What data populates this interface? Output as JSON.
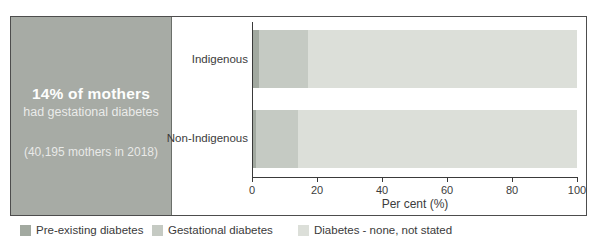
{
  "panel": {
    "headline": "14% of mothers",
    "subline": "had gestational diabetes",
    "note": "(40,195 mothers in 2018)"
  },
  "chart_data": {
    "type": "bar",
    "orientation": "horizontal",
    "stacked": true,
    "categories": [
      "Indigenous",
      "Non-Indigenous"
    ],
    "series": [
      {
        "name": "Pre-existing diabetes",
        "color": "#a2a9a0",
        "values": [
          2,
          1
        ]
      },
      {
        "name": "Gestational diabetes",
        "color": "#c5cac3",
        "values": [
          15,
          13
        ]
      },
      {
        "name": "Diabetes - none, not stated",
        "color": "#dcdfd9",
        "values": [
          83,
          86
        ]
      }
    ],
    "xlabel": "Per cent (%)",
    "xlim": [
      0,
      100
    ],
    "xticks": [
      "0",
      "20",
      "40",
      "60",
      "80",
      "100"
    ],
    "grid": false,
    "legend_position": "bottom"
  }
}
